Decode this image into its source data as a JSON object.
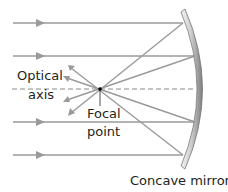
{
  "diagram": {
    "labels": {
      "optical_axis_line1": "Optical",
      "optical_axis_line2": "axis",
      "focal_point_line1": "Focal",
      "focal_point_line2": "point",
      "mirror": "Concave mirror"
    },
    "colors": {
      "ray": "#9a9a9a",
      "axis_dash": "#8a8a8a",
      "mirror_light": "#e6e6e6",
      "mirror_dark": "#8c8c8c",
      "focal_point": "#000000",
      "text": "#231f20"
    },
    "focal_point": {
      "x": 100,
      "y": 89
    },
    "incident_rays": [
      {
        "y": 23,
        "hit_x": 183
      },
      {
        "y": 56,
        "hit_x": 195
      },
      {
        "y": 122,
        "hit_x": 195
      },
      {
        "y": 155,
        "hit_x": 183
      }
    ],
    "reflected_ray_ends": [
      {
        "x": 69,
        "y": 115
      },
      {
        "x": 65,
        "y": 101
      },
      {
        "x": 65,
        "y": 77
      },
      {
        "x": 69,
        "y": 66
      }
    ]
  }
}
